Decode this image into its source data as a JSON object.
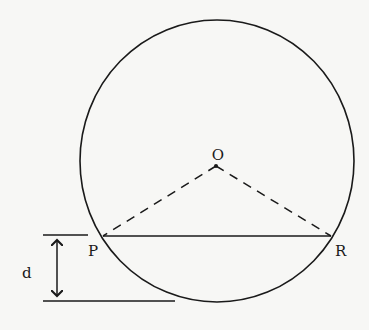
{
  "diagram": {
    "labels": {
      "center": "O",
      "left_point": "P",
      "right_point": "R",
      "distance": "d"
    },
    "colors": {
      "stroke": "#1a1a1a",
      "background": "#f7f7f5"
    }
  }
}
